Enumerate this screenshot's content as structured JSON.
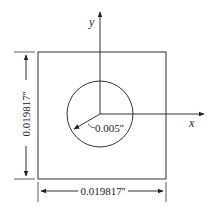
{
  "diagram": {
    "axes": {
      "x_label": "x",
      "y_label": "y"
    },
    "circle": {
      "radius_label": "0.005''"
    },
    "square": {
      "height_label": "0.019817''",
      "width_label": "0.019817''"
    },
    "colors": {
      "stroke": "#222222",
      "background": "#ffffff"
    }
  }
}
